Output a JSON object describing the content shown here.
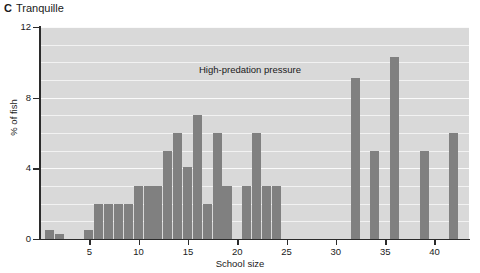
{
  "figure": {
    "panel_letter": "C",
    "title": "Tranquille",
    "annotation": "High-predation pressure"
  },
  "axes": {
    "ylabel": "% of fish",
    "xlabel": "School size",
    "ytick_labels": [
      "0",
      "4",
      "8",
      "12"
    ],
    "xtick_labels": [
      "5",
      "10",
      "15",
      "20",
      "25",
      "30",
      "35",
      "40"
    ]
  },
  "colors": {
    "bar": "#808080",
    "plot_background": "#d9d9d9",
    "gridline": "#f2f2f2",
    "axis": "#2b2b2b",
    "text": "#1a1a1a"
  },
  "chart_data": {
    "type": "bar",
    "xlabel": "School size",
    "ylabel": "% of fish",
    "xlim": [
      0,
      43.5
    ],
    "ylim": [
      0,
      12
    ],
    "yticks": [
      0,
      4,
      8,
      12
    ],
    "xticks": [
      5,
      10,
      15,
      20,
      25,
      30,
      35,
      40
    ],
    "grid": true,
    "grid_spacing_y": 1,
    "legend": null,
    "annotations": [
      {
        "text": "High-predation pressure",
        "x": 17.5,
        "y": 9.0
      }
    ],
    "x": [
      1,
      2,
      5,
      6,
      7,
      8,
      9,
      10,
      11,
      12,
      13,
      14,
      15,
      16,
      17,
      18,
      19,
      21,
      22,
      23,
      24,
      32,
      34,
      36,
      39,
      42
    ],
    "values": [
      0.5,
      0.3,
      0.5,
      2.0,
      2.0,
      2.0,
      2.0,
      3.0,
      3.0,
      3.0,
      5.0,
      6.0,
      4.1,
      7.0,
      2.0,
      6.0,
      3.0,
      3.0,
      6.0,
      3.0,
      3.0,
      9.1,
      5.0,
      10.3,
      5.0,
      6.0
    ],
    "categories": [
      "1",
      "2",
      "5",
      "6",
      "7",
      "8",
      "9",
      "10",
      "11",
      "12",
      "13",
      "14",
      "15",
      "16",
      "17",
      "18",
      "19",
      "21",
      "22",
      "23",
      "24",
      "32",
      "34",
      "36",
      "39",
      "42"
    ]
  }
}
